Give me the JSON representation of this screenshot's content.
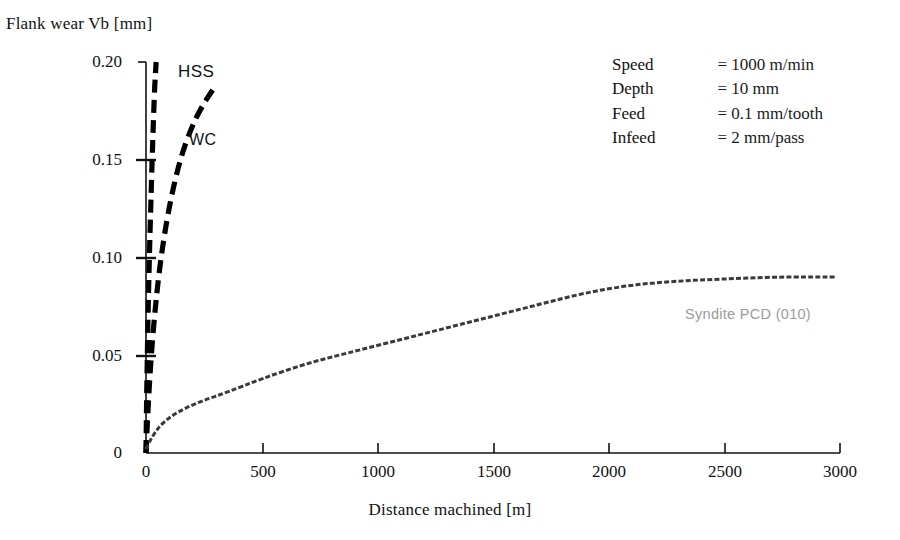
{
  "chart_data": {
    "type": "line",
    "title": "",
    "xlabel": "Distance machined [m]",
    "ylabel": "Flank wear Vb [mm]",
    "xlim": [
      0,
      3000
    ],
    "ylim": [
      0,
      0.2
    ],
    "grid": false,
    "legend_position": "inline-annotations",
    "xticks": [
      0,
      500,
      1000,
      1500,
      2000,
      2500,
      3000
    ],
    "xtick_labels": [
      "0",
      "500",
      "1000",
      "1500",
      "2000",
      "2500",
      "3000"
    ],
    "yticks": [
      0,
      0.05,
      0.1,
      0.15,
      0.2
    ],
    "ytick_labels": [
      "0",
      "0.05",
      "0.10",
      "0.15",
      "0.20"
    ],
    "series": [
      {
        "name": "HSS",
        "style": "thick-dashed",
        "color": "#000000",
        "annotation": "HSS",
        "x": [
          0,
          2,
          5,
          9,
          14,
          20,
          26,
          32,
          38,
          44
        ],
        "y": [
          0.0,
          0.022,
          0.045,
          0.072,
          0.098,
          0.124,
          0.148,
          0.17,
          0.189,
          0.2
        ]
      },
      {
        "name": "WC",
        "style": "thick-dashed",
        "color": "#000000",
        "annotation": "WC",
        "x": [
          0,
          8,
          20,
          38,
          60,
          88,
          120,
          155,
          195,
          240,
          290
        ],
        "y": [
          0.0,
          0.021,
          0.046,
          0.072,
          0.096,
          0.118,
          0.137,
          0.153,
          0.166,
          0.177,
          0.186
        ]
      },
      {
        "name": "Syndite PCD (010)",
        "style": "fine-dashed",
        "color": "#3a3a3a",
        "annotation": "Syndite PCD (010)",
        "x": [
          0,
          25,
          60,
          110,
          170,
          250,
          350,
          500,
          700,
          900,
          1100,
          1300,
          1500,
          1700,
          1900,
          2100,
          2300,
          2500,
          2700,
          2900,
          2980
        ],
        "y": [
          0.002,
          0.008,
          0.014,
          0.019,
          0.023,
          0.027,
          0.031,
          0.038,
          0.046,
          0.052,
          0.058,
          0.064,
          0.07,
          0.076,
          0.082,
          0.086,
          0.088,
          0.089,
          0.09,
          0.09,
          0.09
        ]
      }
    ]
  },
  "axis": {
    "y_title": "Flank wear Vb [mm]",
    "x_title": "Distance machined [m]",
    "y_ticks": [
      "0.20",
      "0.15",
      "0.10",
      "0.05",
      "0"
    ],
    "x_ticks": [
      "0",
      "500",
      "1000",
      "1500",
      "2000",
      "2500",
      "3000"
    ]
  },
  "annotations": {
    "hss": "HSS",
    "wc": "WC",
    "pcd": "Syndite PCD (010)"
  },
  "parameters": {
    "rows": [
      {
        "name": "Speed",
        "value": "= 1000 m/min"
      },
      {
        "name": "Depth",
        "value": "= 10 mm"
      },
      {
        "name": "Feed",
        "value": "= 0.1 mm/tooth"
      },
      {
        "name": "Infeed",
        "value": "= 2 mm/pass"
      }
    ]
  },
  "colors": {
    "ink": "#000000",
    "pcd_curve": "#3a3a3a",
    "pcd_label": "#9b9b9b",
    "background": "#ffffff"
  }
}
